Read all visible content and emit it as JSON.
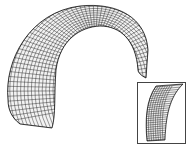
{
  "figure": {
    "mesh_color": "#222222",
    "background": "#ffffff",
    "inset": {
      "label": "",
      "border_color": "#444444"
    }
  }
}
